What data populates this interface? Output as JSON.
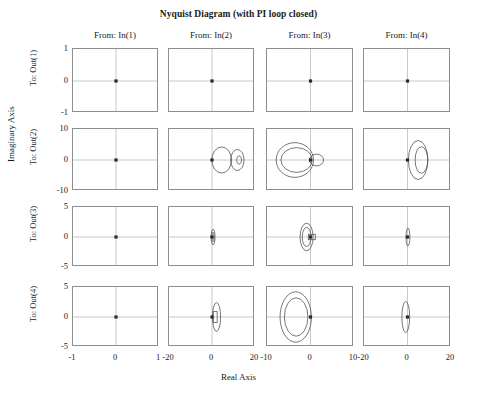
{
  "figure": {
    "title": "Nyquist Diagram (with PI loop closed)",
    "xlabel": "Real Axis",
    "ylabel": "Imaginary Axis"
  },
  "columns": [
    {
      "header": "From: In(1)",
      "xticks": [
        "-1",
        "0",
        "1"
      ],
      "xlim": [
        -1,
        1
      ]
    },
    {
      "header": "From: In(2)",
      "xticks": [
        "-20",
        "0",
        "20"
      ],
      "xlim": [
        -20,
        20
      ]
    },
    {
      "header": "From: In(3)",
      "xticks": [
        "-10",
        "0",
        "10"
      ],
      "xlim": [
        -10,
        10
      ]
    },
    {
      "header": "From: In(4)",
      "xticks": [
        "-20",
        "0",
        "20"
      ],
      "xlim": [
        -20,
        20
      ]
    }
  ],
  "rows": [
    {
      "label": "To: Out(1)",
      "yticks": [
        "1",
        "0",
        "-1"
      ],
      "ylim": [
        -1,
        1
      ]
    },
    {
      "label": "To: Out(2)",
      "yticks": [
        "10",
        "0",
        "-10"
      ],
      "ylim": [
        -10,
        10
      ]
    },
    {
      "label": "To: Out(3)",
      "yticks": [
        "5",
        "0",
        "-5"
      ],
      "ylim": [
        -5,
        5
      ]
    },
    {
      "label": "To: Out(4)",
      "yticks": [
        "5",
        "0",
        "-5"
      ],
      "ylim": [
        -5,
        5
      ]
    }
  ],
  "colors": {
    "curve": "#55545a",
    "grid": "#c8c8c8",
    "axis_border": "#8e8e8e",
    "marker": "#2a2a2a",
    "text": "#1a1a1a",
    "background": "#ffffff"
  },
  "chart_data": {
    "type": "scatter",
    "title": "Nyquist Diagram (with PI loop closed)",
    "xlabel": "Real Axis",
    "ylabel": "Imaginary Axis",
    "grid": true,
    "legend": null,
    "layout": {
      "rows": 4,
      "cols": 4,
      "shared_row_ylim": true,
      "shared_col_xlim": true
    },
    "panels": [
      {
        "row": 0,
        "col": 0,
        "from": "In(1)",
        "to": "Out(1)",
        "xlim": [
          -1,
          1
        ],
        "ylim": [
          -1,
          1
        ],
        "markers": [
          [
            0,
            0
          ]
        ],
        "loops": []
      },
      {
        "row": 0,
        "col": 1,
        "from": "In(2)",
        "to": "Out(1)",
        "xlim": [
          -20,
          20
        ],
        "ylim": [
          -1,
          1
        ],
        "markers": [
          [
            0,
            0
          ]
        ],
        "loops": []
      },
      {
        "row": 0,
        "col": 2,
        "from": "In(3)",
        "to": "Out(1)",
        "xlim": [
          -10,
          10
        ],
        "ylim": [
          -1,
          1
        ],
        "markers": [
          [
            0,
            0
          ]
        ],
        "loops": []
      },
      {
        "row": 0,
        "col": 3,
        "from": "In(4)",
        "to": "Out(1)",
        "xlim": [
          -20,
          20
        ],
        "ylim": [
          -1,
          1
        ],
        "markers": [
          [
            0,
            0
          ]
        ],
        "loops": []
      },
      {
        "row": 1,
        "col": 0,
        "from": "In(1)",
        "to": "Out(2)",
        "xlim": [
          -1,
          1
        ],
        "ylim": [
          -10,
          10
        ],
        "markers": [
          [
            0,
            0
          ]
        ],
        "loops": []
      },
      {
        "row": 1,
        "col": 1,
        "from": "In(2)",
        "to": "Out(2)",
        "xlim": [
          -20,
          20
        ],
        "ylim": [
          -10,
          10
        ],
        "markers": [
          [
            0,
            0
          ]
        ],
        "loops": [
          {
            "shape": "oval",
            "cx": 4.5,
            "cy": 0,
            "rx": 4.6,
            "ry": 4.2
          },
          {
            "shape": "oval",
            "cx": 11.8,
            "cy": 0,
            "rx": 3.1,
            "ry": 3.4
          },
          {
            "shape": "oval",
            "cx": 12.6,
            "cy": 0,
            "rx": 1.1,
            "ry": 1.3
          }
        ]
      },
      {
        "row": 1,
        "col": 2,
        "from": "In(3)",
        "to": "Out(2)",
        "xlim": [
          -10,
          10
        ],
        "ylim": [
          -10,
          10
        ],
        "markers": [
          [
            0,
            0
          ]
        ],
        "loops": [
          {
            "shape": "oval",
            "cx": -3.6,
            "cy": 0,
            "rx": 4.3,
            "ry": 5.6
          },
          {
            "shape": "oval",
            "cx": -3.2,
            "cy": 0,
            "rx": 3.6,
            "ry": 4.0
          },
          {
            "shape": "oval",
            "cx": 1.4,
            "cy": 0,
            "rx": 1.6,
            "ry": 1.9
          }
        ]
      },
      {
        "row": 1,
        "col": 3,
        "from": "In(4)",
        "to": "Out(2)",
        "xlim": [
          -20,
          20
        ],
        "ylim": [
          -10,
          10
        ],
        "markers": [
          [
            0,
            0
          ]
        ],
        "loops": [
          {
            "shape": "oval",
            "cx": 4.9,
            "cy": 0,
            "rx": 4.5,
            "ry": 6.3
          },
          {
            "shape": "oval",
            "cx": 6.4,
            "cy": 0,
            "rx": 2.9,
            "ry": 4.3
          }
        ]
      },
      {
        "row": 2,
        "col": 0,
        "from": "In(1)",
        "to": "Out(3)",
        "xlim": [
          -1,
          1
        ],
        "ylim": [
          -5,
          5
        ],
        "markers": [
          [
            0,
            0
          ]
        ],
        "loops": []
      },
      {
        "row": 2,
        "col": 1,
        "from": "In(2)",
        "to": "Out(3)",
        "xlim": [
          -20,
          20
        ],
        "ylim": [
          -5,
          5
        ],
        "markers": [
          [
            0,
            0
          ]
        ],
        "loops": [
          {
            "shape": "oval",
            "cx": 0.5,
            "cy": 0,
            "rx": 0.9,
            "ry": 1.3
          },
          {
            "shape": "oval",
            "cx": 0.5,
            "cy": 0,
            "rx": 0.5,
            "ry": 0.8
          }
        ]
      },
      {
        "row": 2,
        "col": 2,
        "from": "In(3)",
        "to": "Out(3)",
        "xlim": [
          -10,
          10
        ],
        "ylim": [
          -5,
          5
        ],
        "markers": [
          [
            0,
            0
          ]
        ],
        "loops": [
          {
            "shape": "oval",
            "cx": -0.9,
            "cy": 0,
            "rx": 1.5,
            "ry": 2.3
          },
          {
            "shape": "oval",
            "cx": -0.9,
            "cy": 0,
            "rx": 1.0,
            "ry": 1.6
          },
          {
            "shape": "rect",
            "cx": 0.3,
            "cy": 0,
            "rx": 0.8,
            "ry": 0.45
          }
        ]
      },
      {
        "row": 2,
        "col": 3,
        "from": "In(4)",
        "to": "Out(3)",
        "xlim": [
          -20,
          20
        ],
        "ylim": [
          -5,
          5
        ],
        "markers": [
          [
            0,
            0
          ]
        ],
        "loops": [
          {
            "shape": "oval",
            "cx": 0.2,
            "cy": 0,
            "rx": 0.9,
            "ry": 1.5
          }
        ]
      },
      {
        "row": 3,
        "col": 0,
        "from": "In(1)",
        "to": "Out(4)",
        "xlim": [
          -1,
          1
        ],
        "ylim": [
          -5,
          5
        ],
        "markers": [
          [
            0,
            0
          ]
        ],
        "loops": []
      },
      {
        "row": 3,
        "col": 1,
        "from": "In(2)",
        "to": "Out(4)",
        "xlim": [
          -20,
          20
        ],
        "ylim": [
          -5,
          5
        ],
        "markers": [
          [
            0,
            0
          ]
        ],
        "loops": [
          {
            "shape": "oval",
            "cx": 2.1,
            "cy": 0,
            "rx": 1.9,
            "ry": 2.4
          },
          {
            "shape": "rect",
            "cx": 1.5,
            "cy": 0,
            "rx": 0.9,
            "ry": 0.9
          }
        ]
      },
      {
        "row": 3,
        "col": 2,
        "from": "In(3)",
        "to": "Out(4)",
        "xlim": [
          -10,
          10
        ],
        "ylim": [
          -5,
          5
        ],
        "markers": [
          [
            0,
            0
          ]
        ],
        "loops": [
          {
            "shape": "oval",
            "cx": -3.4,
            "cy": 0,
            "rx": 3.6,
            "ry": 4.2
          },
          {
            "shape": "oval",
            "cx": -3.3,
            "cy": 0,
            "rx": 2.7,
            "ry": 3.2
          }
        ]
      },
      {
        "row": 3,
        "col": 3,
        "from": "In(4)",
        "to": "Out(4)",
        "xlim": [
          -20,
          20
        ],
        "ylim": [
          -5,
          5
        ],
        "markers": [
          [
            0,
            0
          ]
        ],
        "loops": [
          {
            "shape": "oval",
            "cx": -0.8,
            "cy": 0,
            "rx": 1.8,
            "ry": 2.6
          }
        ]
      }
    ]
  }
}
